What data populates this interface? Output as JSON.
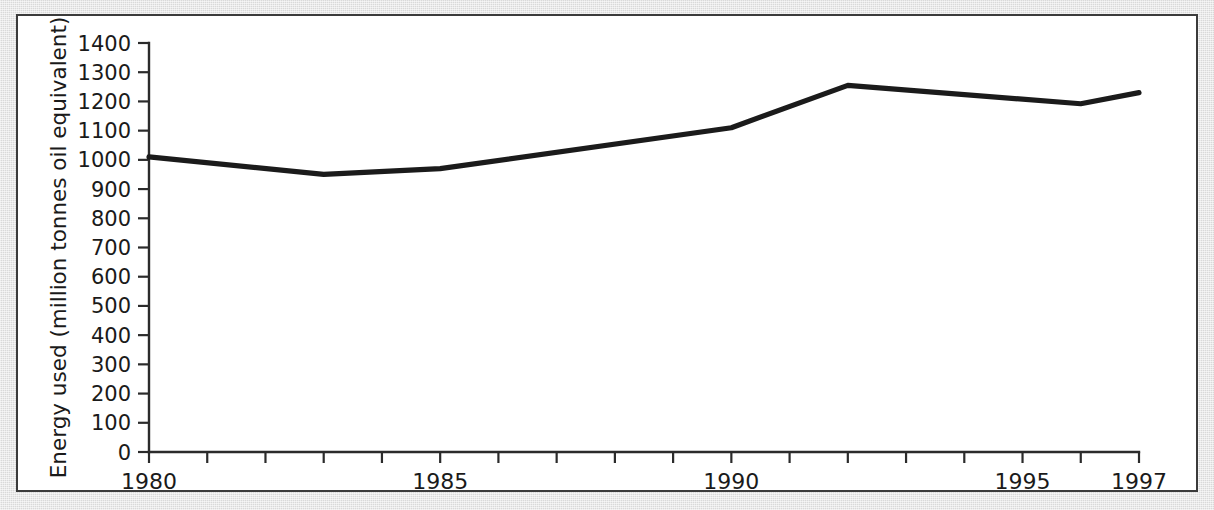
{
  "figure": {
    "background_color": "#d9d9d9",
    "panel_color": "#ffffff",
    "border_color": "#3b3b3b",
    "line_color": "#1b1b1b",
    "text_color": "#1a1a1a"
  },
  "chart_data": {
    "type": "line",
    "title": "",
    "subtitle": "",
    "xlabel": "",
    "ylabel": "Energy used (million tonnes oil equivalent)",
    "x": [
      1980,
      1983,
      1985,
      1990,
      1992,
      1996,
      1997
    ],
    "values": [
      1010,
      950,
      970,
      1110,
      1255,
      1192,
      1230
    ],
    "series": [
      {
        "name": "Energy used",
        "x": [
          1980,
          1983,
          1985,
          1990,
          1992,
          1996,
          1997
        ],
        "values": [
          1010,
          950,
          970,
          1110,
          1255,
          1192,
          1230
        ]
      }
    ],
    "xlim": [
      1980,
      1997
    ],
    "ylim": [
      0,
      1400
    ],
    "grid": false,
    "legend": false,
    "legend_position": "none",
    "y_ticks": [
      0,
      100,
      200,
      300,
      400,
      500,
      600,
      700,
      800,
      900,
      1000,
      1100,
      1200,
      1300,
      1400
    ],
    "y_tick_labels": [
      "0",
      "100",
      "200",
      "300",
      "400",
      "500",
      "600",
      "700",
      "800",
      "900",
      "1000",
      "1100",
      "1200",
      "1300",
      "1400"
    ],
    "x_ticks": [
      1980,
      1981,
      1982,
      1983,
      1984,
      1985,
      1986,
      1987,
      1988,
      1989,
      1990,
      1991,
      1992,
      1993,
      1994,
      1995,
      1996,
      1997
    ],
    "x_tick_labels": [
      {
        "value": 1980,
        "label": "1980"
      },
      {
        "value": 1985,
        "label": "1985"
      },
      {
        "value": 1990,
        "label": "1990"
      },
      {
        "value": 1995,
        "label": "1995"
      },
      {
        "value": 1997,
        "label": "1997"
      }
    ],
    "annotations": []
  }
}
